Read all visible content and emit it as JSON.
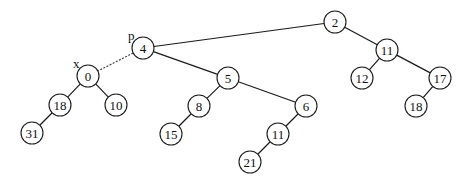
{
  "diagram": {
    "type": "binary-tree",
    "node_radius": 11,
    "nodes": [
      {
        "id": "n2",
        "label": "2",
        "x": 335,
        "y": 22
      },
      {
        "id": "n4",
        "label": "4",
        "x": 143,
        "y": 48
      },
      {
        "id": "n11a",
        "label": "11",
        "x": 387,
        "y": 50
      },
      {
        "id": "n12",
        "label": "12",
        "x": 362,
        "y": 78
      },
      {
        "id": "n17",
        "label": "17",
        "x": 440,
        "y": 78
      },
      {
        "id": "n18b",
        "label": "18",
        "x": 416,
        "y": 106
      },
      {
        "id": "n0",
        "label": "0",
        "x": 88,
        "y": 76
      },
      {
        "id": "n5",
        "label": "5",
        "x": 228,
        "y": 78
      },
      {
        "id": "n18a",
        "label": "18",
        "x": 60,
        "y": 105
      },
      {
        "id": "n10",
        "label": "10",
        "x": 116,
        "y": 105
      },
      {
        "id": "n8",
        "label": "8",
        "x": 199,
        "y": 106
      },
      {
        "id": "n6",
        "label": "6",
        "x": 306,
        "y": 106
      },
      {
        "id": "n31",
        "label": "31",
        "x": 32,
        "y": 133
      },
      {
        "id": "n15",
        "label": "15",
        "x": 171,
        "y": 134
      },
      {
        "id": "n11b",
        "label": "11",
        "x": 278,
        "y": 134
      },
      {
        "id": "n21",
        "label": "21",
        "x": 250,
        "y": 162
      }
    ],
    "edges": [
      {
        "from": "n2",
        "to": "n4",
        "style": "solid"
      },
      {
        "from": "n2",
        "to": "n11a",
        "style": "solid"
      },
      {
        "from": "n11a",
        "to": "n12",
        "style": "solid"
      },
      {
        "from": "n11a",
        "to": "n17",
        "style": "solid"
      },
      {
        "from": "n17",
        "to": "n18b",
        "style": "solid"
      },
      {
        "from": "n4",
        "to": "n0",
        "style": "dashed"
      },
      {
        "from": "n4",
        "to": "n5",
        "style": "solid"
      },
      {
        "from": "n0",
        "to": "n18a",
        "style": "solid"
      },
      {
        "from": "n0",
        "to": "n10",
        "style": "solid"
      },
      {
        "from": "n18a",
        "to": "n31",
        "style": "solid"
      },
      {
        "from": "n5",
        "to": "n8",
        "style": "solid"
      },
      {
        "from": "n5",
        "to": "n6",
        "style": "solid"
      },
      {
        "from": "n8",
        "to": "n15",
        "style": "solid"
      },
      {
        "from": "n6",
        "to": "n11b",
        "style": "solid"
      },
      {
        "from": "n11b",
        "to": "n21",
        "style": "solid"
      }
    ],
    "pointer_labels": [
      {
        "label": "p",
        "target": "n4",
        "x": 128,
        "y": 40
      },
      {
        "label": "x",
        "target": "n0",
        "x": 73,
        "y": 68
      }
    ]
  }
}
